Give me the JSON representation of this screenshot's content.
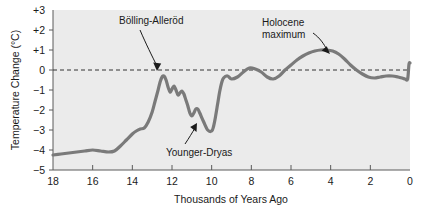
{
  "chart_data": {
    "type": "line",
    "title": "",
    "xlabel": "Thousands of Years Ago",
    "ylabel": "Temperature Change (°C)",
    "xlim": [
      18,
      0
    ],
    "ylim": [
      -5,
      3
    ],
    "x_ticks": [
      18,
      16,
      14,
      12,
      10,
      8,
      6,
      4,
      2,
      0
    ],
    "x_tick_labels": [
      "18",
      "16",
      "14",
      "12",
      "10",
      "8",
      "6",
      "4",
      "2",
      "0"
    ],
    "y_ticks": [
      3,
      2,
      1,
      0,
      -1,
      -2,
      -3,
      -4,
      -5
    ],
    "y_tick_labels": [
      "+3",
      "+2",
      "+1",
      "0",
      "−1",
      "−2",
      "−3",
      "−4",
      "−5"
    ],
    "grid": false,
    "legend": "none",
    "zero_reference_line": 0,
    "line_color": "#7a7a7a",
    "plot_background": "#ebebeb",
    "series": [
      {
        "name": "Temperature change",
        "x": [
          18.0,
          17.6,
          17.2,
          16.8,
          16.4,
          16.0,
          15.6,
          15.2,
          14.9,
          14.6,
          14.3,
          14.0,
          13.8,
          13.6,
          13.4,
          13.2,
          13.0,
          12.85,
          12.7,
          12.6,
          12.5,
          12.4,
          12.3,
          12.2,
          12.1,
          12.0,
          11.9,
          11.8,
          11.7,
          11.6,
          11.5,
          11.4,
          11.3,
          11.2,
          11.1,
          11.0,
          10.9,
          10.8,
          10.7,
          10.6,
          10.4,
          10.2,
          10.0,
          9.9,
          9.8,
          9.7,
          9.6,
          9.5,
          9.4,
          9.2,
          9.0,
          8.7,
          8.4,
          8.1,
          7.8,
          7.5,
          7.2,
          6.9,
          6.6,
          6.3,
          6.0,
          5.7,
          5.4,
          5.1,
          4.8,
          4.5,
          4.2,
          3.9,
          3.6,
          3.3,
          3.0,
          2.7,
          2.4,
          2.1,
          1.8,
          1.5,
          1.2,
          0.9,
          0.6,
          0.4,
          0.25,
          0.12,
          0.05,
          0.0
        ],
        "y": [
          -4.25,
          -4.2,
          -4.15,
          -4.1,
          -4.05,
          -4.0,
          -4.05,
          -4.1,
          -4.05,
          -3.8,
          -3.5,
          -3.2,
          -3.05,
          -2.95,
          -2.9,
          -2.6,
          -2.1,
          -1.55,
          -1.0,
          -0.6,
          -0.35,
          -0.3,
          -0.5,
          -0.85,
          -1.1,
          -0.95,
          -0.8,
          -1.0,
          -1.25,
          -1.15,
          -1.05,
          -1.2,
          -1.5,
          -1.8,
          -2.15,
          -2.3,
          -2.15,
          -1.95,
          -1.95,
          -2.15,
          -2.6,
          -3.0,
          -3.05,
          -2.8,
          -2.3,
          -1.7,
          -1.1,
          -0.65,
          -0.4,
          -0.3,
          -0.45,
          -0.35,
          -0.1,
          0.1,
          0.05,
          -0.1,
          -0.35,
          -0.45,
          -0.3,
          0.0,
          0.25,
          0.5,
          0.7,
          0.85,
          0.95,
          1.0,
          1.0,
          0.95,
          0.8,
          0.55,
          0.25,
          0.0,
          -0.2,
          -0.35,
          -0.4,
          -0.35,
          -0.3,
          -0.3,
          -0.35,
          -0.4,
          -0.45,
          -0.45,
          0.3,
          0.35
        ]
      }
    ],
    "annotations": [
      {
        "label": "Bölling-Alleröd",
        "target_x": 12.5,
        "target_y": -0.35
      },
      {
        "label": "Holocene\nmaximum",
        "target_x": 5.6,
        "target_y": 1.0
      },
      {
        "label": "Younger-Dryas",
        "target_x": 10.2,
        "target_y": -3.0
      }
    ]
  },
  "annotations": {
    "bolling_allerod": "Bölling-Alleröd",
    "holocene_line1": "Holocene",
    "holocene_line2": "maximum",
    "younger_dryas": "Younger-Dryas"
  },
  "axes": {
    "x_title": "Thousands of Years Ago",
    "y_title": "Temperature Change (°C)",
    "x_labels": [
      "18",
      "16",
      "14",
      "12",
      "10",
      "8",
      "6",
      "4",
      "2",
      "0"
    ],
    "y_labels": [
      "+3",
      "+2",
      "+1",
      "0",
      "−1",
      "−2",
      "−3",
      "−4",
      "−5"
    ]
  }
}
